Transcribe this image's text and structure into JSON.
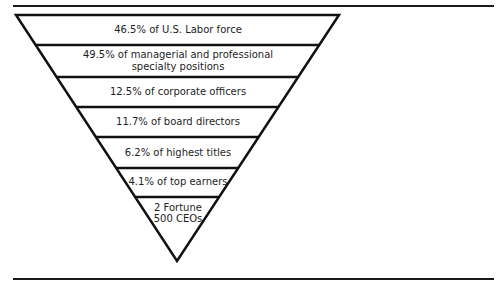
{
  "diagram": {
    "type": "inverted-pyramid",
    "stroke_color": "#111111",
    "text_color": "#1e1e1e",
    "levels": [
      {
        "label": "46.5% of U.S. Labor force"
      },
      {
        "label": "49.5% of managerial and professional",
        "label2": "specialty positions"
      },
      {
        "label": "12.5% of corporate officers"
      },
      {
        "label": "11.7% of board directors"
      },
      {
        "label": "6.2% of highest titles"
      },
      {
        "label": "4.1% of top earners"
      },
      {
        "label": "2 Fortune",
        "label2": "500 CEOs"
      }
    ]
  }
}
